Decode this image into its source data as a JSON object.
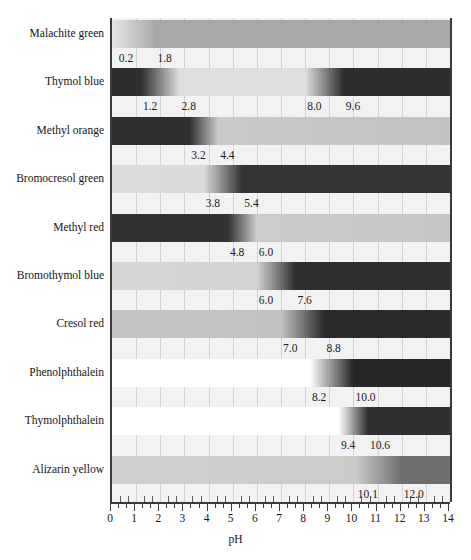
{
  "chart_data": {
    "type": "bar",
    "title": "",
    "xlabel": "pH",
    "ylabel": "",
    "xlim": [
      0,
      14
    ],
    "grid": true,
    "legend": "none",
    "axis": {
      "label": "pH",
      "tick_labels": [
        "0",
        "1",
        "2",
        "3",
        "4",
        "5",
        "6",
        "7",
        "8",
        "9",
        "10",
        "11",
        "12",
        "13",
        "14"
      ],
      "tick_values": [
        0,
        1,
        2,
        3,
        4,
        5,
        6,
        7,
        8,
        9,
        10,
        11,
        12,
        13,
        14
      ],
      "minor_ticks_per_interval": 2
    },
    "categories": [
      "Malachite green",
      "Thymol blue",
      "Methyl orange",
      "Bromocresol green",
      "Methyl red",
      "Bromothymol blue",
      "Cresol red",
      "Phenolphthalein",
      "Thymolphthalein",
      "Alizarin yellow"
    ],
    "indicators": [
      {
        "name": "Malachite green",
        "transitions": [
          {
            "low": 0.2,
            "high": 1.8,
            "low_label": "0.2",
            "high_label": "1.8"
          }
        ],
        "acid_color": "#e4e4e4",
        "base_color": "#a8a8a8",
        "stops": [
          {
            "ph": 0.0,
            "color": "#e4e4e4"
          },
          {
            "ph": 0.2,
            "color": "#e0e0e0"
          },
          {
            "ph": 1.8,
            "color": "#a8a8a8"
          },
          {
            "ph": 14.0,
            "color": "#a8a8a8"
          }
        ]
      },
      {
        "name": "Thymol blue",
        "transitions": [
          {
            "low": 1.2,
            "high": 2.8,
            "low_label": "1.2",
            "high_label": "2.8"
          },
          {
            "low": 8.0,
            "high": 9.6,
            "low_label": "8.0",
            "high_label": "9.6"
          }
        ],
        "acid_color": "#2e2e2e",
        "base_color": "#2e2e2e",
        "stops": [
          {
            "ph": 0.0,
            "color": "#2e2e2e"
          },
          {
            "ph": 1.2,
            "color": "#2e2e2e"
          },
          {
            "ph": 2.8,
            "color": "#dedede"
          },
          {
            "ph": 8.0,
            "color": "#dedede"
          },
          {
            "ph": 9.6,
            "color": "#2e2e2e"
          },
          {
            "ph": 14.0,
            "color": "#2e2e2e"
          }
        ]
      },
      {
        "name": "Methyl orange",
        "transitions": [
          {
            "low": 3.2,
            "high": 4.4,
            "low_label": "3.2",
            "high_label": "4.4"
          }
        ],
        "acid_color": "#2f2f2f",
        "base_color": "#c9c9c9",
        "stops": [
          {
            "ph": 0.0,
            "color": "#2f2f2f"
          },
          {
            "ph": 3.2,
            "color": "#2f2f2f"
          },
          {
            "ph": 4.4,
            "color": "#cacaca"
          },
          {
            "ph": 14.0,
            "color": "#c2c2c2"
          }
        ]
      },
      {
        "name": "Bromocresol green",
        "transitions": [
          {
            "low": 3.8,
            "high": 5.4,
            "low_label": "3.8",
            "high_label": "5.4"
          }
        ],
        "acid_color": "#dcdcdc",
        "base_color": "#333333",
        "stops": [
          {
            "ph": 0.0,
            "color": "#dcdcdc"
          },
          {
            "ph": 3.8,
            "color": "#dadada"
          },
          {
            "ph": 5.4,
            "color": "#333333"
          },
          {
            "ph": 14.0,
            "color": "#333333"
          }
        ]
      },
      {
        "name": "Methyl red",
        "transitions": [
          {
            "low": 4.8,
            "high": 6.0,
            "low_label": "4.8",
            "high_label": "6.0"
          }
        ],
        "acid_color": "#323232",
        "base_color": "#c9c9c9",
        "stops": [
          {
            "ph": 0.0,
            "color": "#323232"
          },
          {
            "ph": 4.8,
            "color": "#323232"
          },
          {
            "ph": 6.0,
            "color": "#cccccc"
          },
          {
            "ph": 14.0,
            "color": "#c6c6c6"
          }
        ]
      },
      {
        "name": "Bromothymol blue",
        "transitions": [
          {
            "low": 6.0,
            "high": 7.6,
            "low_label": "6.0",
            "high_label": "7.6"
          }
        ],
        "acid_color": "#d4d4d4",
        "base_color": "#2f2f2f",
        "stops": [
          {
            "ph": 0.0,
            "color": "#d6d6d6"
          },
          {
            "ph": 6.0,
            "color": "#d2d2d2"
          },
          {
            "ph": 7.6,
            "color": "#2f2f2f"
          },
          {
            "ph": 14.0,
            "color": "#2f2f2f"
          }
        ]
      },
      {
        "name": "Cresol red",
        "transitions": [
          {
            "low": 7.0,
            "high": 8.8,
            "low_label": "7.0",
            "high_label": "8.8"
          }
        ],
        "acid_color": "#c4c4c4",
        "base_color": "#2a2a2a",
        "stops": [
          {
            "ph": 0.0,
            "color": "#c4c4c4"
          },
          {
            "ph": 7.0,
            "color": "#c2c2c2"
          },
          {
            "ph": 8.8,
            "color": "#2a2a2a"
          },
          {
            "ph": 14.0,
            "color": "#2a2a2a"
          }
        ]
      },
      {
        "name": "Phenolphthalein",
        "transitions": [
          {
            "low": 8.2,
            "high": 10.0,
            "low_label": "8.2",
            "high_label": "10.0"
          }
        ],
        "acid_color": "#ffffff",
        "base_color": "#262626",
        "stops": [
          {
            "ph": 0.0,
            "color": "#ffffff"
          },
          {
            "ph": 8.2,
            "color": "#ffffff"
          },
          {
            "ph": 10.0,
            "color": "#262626"
          },
          {
            "ph": 14.0,
            "color": "#262626"
          }
        ]
      },
      {
        "name": "Thymolphthalein",
        "transitions": [
          {
            "low": 9.4,
            "high": 10.6,
            "low_label": "9.4",
            "high_label": "10.6"
          }
        ],
        "acid_color": "#ffffff",
        "base_color": "#303030",
        "stops": [
          {
            "ph": 0.0,
            "color": "#ffffff"
          },
          {
            "ph": 9.4,
            "color": "#ffffff"
          },
          {
            "ph": 10.6,
            "color": "#303030"
          },
          {
            "ph": 14.0,
            "color": "#303030"
          }
        ]
      },
      {
        "name": "Alizarin yellow",
        "transitions": [
          {
            "low": 10.1,
            "high": 12.0,
            "low_label": "10.1",
            "high_label": "12.0"
          }
        ],
        "acid_color": "#cecece",
        "base_color": "#6e6e6e",
        "stops": [
          {
            "ph": 0.0,
            "color": "#cfcfcf"
          },
          {
            "ph": 10.1,
            "color": "#cbcbcb"
          },
          {
            "ph": 12.0,
            "color": "#6e6e6e"
          },
          {
            "ph": 14.0,
            "color": "#6e6e6e"
          }
        ]
      }
    ]
  },
  "colors": {
    "plot_background": "#f2f2f2",
    "gridline": "#d2d2d2",
    "axis": "#3a3a3a",
    "text": "#141414"
  }
}
